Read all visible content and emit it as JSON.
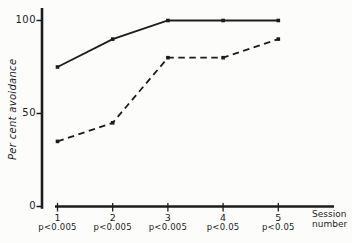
{
  "chart_data": {
    "type": "line",
    "title": "",
    "ylabel": "Per cent avoidance",
    "xlabel": "Session number",
    "xlabel_lines": [
      "Session",
      "number"
    ],
    "categories": [
      "1",
      "2",
      "3",
      "4",
      "5"
    ],
    "p_values": [
      "p<0.005",
      "p<0.005",
      "p<0.005",
      "p<0.05",
      "p<0.05"
    ],
    "y_tick_labels": [
      "100",
      "50",
      "0"
    ],
    "y_ticks": [
      100,
      50,
      0
    ],
    "ylim": [
      0,
      108
    ],
    "grid": "off",
    "legend": "none",
    "series": [
      {
        "name": "solid",
        "line_style": "solid",
        "marker": "square",
        "values": [
          75,
          90,
          100,
          100,
          100
        ]
      },
      {
        "name": "dashed",
        "line_style": "dashed",
        "marker": "square",
        "values": [
          35,
          45,
          80,
          80,
          90
        ]
      }
    ],
    "ink_color": "#1c1c1c",
    "background_color": "#fcfcfb"
  }
}
